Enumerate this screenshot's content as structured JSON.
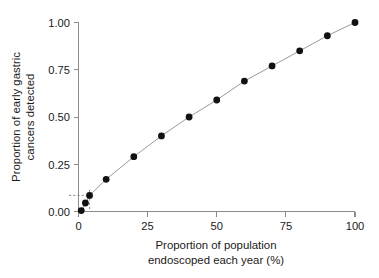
{
  "chart_data": {
    "type": "scatter",
    "title": "",
    "xlabel": "Proportion of population endoscoped each year (%)",
    "xlabel_line1": "Proportion of population",
    "xlabel_line2": "endoscoped each year (%)",
    "ylabel": "Proportion of early gastric cancers detected",
    "ylabel_line1": "Proportion of early gastric",
    "ylabel_line2": "cancers detected",
    "xlim": [
      0,
      100
    ],
    "ylim": [
      0,
      1.0
    ],
    "grid": false,
    "legend": "none",
    "marker": "filled-circle",
    "line_style": "solid-connecting-line",
    "xticks": [
      0,
      25,
      50,
      75,
      100
    ],
    "xtick_labels": [
      "0",
      "25",
      "50",
      "75",
      "100"
    ],
    "yticks": [
      0.0,
      0.25,
      0.5,
      0.75,
      1.0
    ],
    "ytick_labels": [
      "0.00",
      "0.25",
      "0.50",
      "0.75",
      "1.00"
    ],
    "colors": {
      "marker": "#111111",
      "line": "#9a9a9a",
      "axis": "#8c8c8c",
      "text": "#1a1a1a",
      "background": "#ffffff"
    },
    "x": [
      1,
      2.5,
      4,
      10,
      20,
      30,
      40,
      50,
      60,
      70,
      80,
      90,
      100
    ],
    "y": [
      0.005,
      0.045,
      0.085,
      0.17,
      0.29,
      0.4,
      0.5,
      0.59,
      0.69,
      0.77,
      0.85,
      0.93,
      1.0
    ],
    "points": [
      {
        "x": 1,
        "y": 0.005
      },
      {
        "x": 2.5,
        "y": 0.045
      },
      {
        "x": 4,
        "y": 0.085
      },
      {
        "x": 10,
        "y": 0.17
      },
      {
        "x": 20,
        "y": 0.29
      },
      {
        "x": 30,
        "y": 0.4
      },
      {
        "x": 40,
        "y": 0.5
      },
      {
        "x": 50,
        "y": 0.59
      },
      {
        "x": 60,
        "y": 0.69
      },
      {
        "x": 70,
        "y": 0.77
      },
      {
        "x": 80,
        "y": 0.85
      },
      {
        "x": 90,
        "y": 0.93
      },
      {
        "x": 100,
        "y": 1.0
      }
    ],
    "annotations": [
      {
        "name": "reference-line-horizontal",
        "type": "dashed-line",
        "y": 0.085,
        "x_from": 0,
        "x_to": 4
      },
      {
        "name": "reference-line-vertical",
        "type": "dashed-line",
        "x": 4,
        "y_from": 0,
        "y_to": 0.085
      }
    ]
  }
}
